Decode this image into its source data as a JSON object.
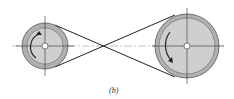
{
  "diagram": {
    "caption": "(b)",
    "small_pulley": {
      "rotation": "clockwise"
    },
    "large_pulley": {
      "rotation": "clockwise"
    },
    "colors": {
      "pulley_rim": "#a8a8a8",
      "pulley_face": "#c8c8c8",
      "belt": "#222222",
      "centerline": "#444444"
    }
  }
}
